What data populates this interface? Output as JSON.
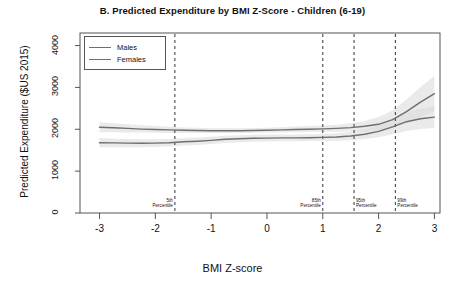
{
  "chart_data": {
    "type": "line",
    "title": "B. Predicted Expenditure by BMI Z-Score - Children (6-19)",
    "xlabel": "BMI Z-score",
    "ylabel": "Predicted Expenditure ($US 2015)",
    "xlim": [
      -3.35,
      3.1
    ],
    "ylim": [
      0,
      4300
    ],
    "xticks": [
      -3,
      -2,
      -1,
      0,
      1,
      2,
      3
    ],
    "xtick_labels": [
      "-3",
      "-2",
      "-1",
      "0",
      "1",
      "2",
      "3"
    ],
    "yticks": [
      0,
      1000,
      2000,
      3000,
      4000
    ],
    "ytick_labels": [
      "0",
      "1000",
      "2000",
      "3000",
      "4000"
    ],
    "grid": false,
    "legend_position": "top-left",
    "legend_entries": [
      "Males",
      "Females"
    ],
    "line_color": "#6f6f6f",
    "band_color": "#d9d9d9",
    "x": [
      -3.0,
      -2.75,
      -2.5,
      -2.25,
      -2.0,
      -1.75,
      -1.5,
      -1.25,
      -1.0,
      -0.75,
      -0.5,
      -0.25,
      0.0,
      0.25,
      0.5,
      0.75,
      1.0,
      1.25,
      1.5,
      1.75,
      2.0,
      2.25,
      2.5,
      2.75,
      3.0
    ],
    "series": [
      {
        "name": "Males",
        "values": [
          2050,
          2035,
          2020,
          2005,
          1995,
          1985,
          1975,
          1970,
          1965,
          1965,
          1965,
          1970,
          1975,
          1985,
          1995,
          2000,
          2010,
          2020,
          2040,
          2070,
          2120,
          2230,
          2420,
          2650,
          2850
        ],
        "ci_low": [
          1930,
          1930,
          1925,
          1920,
          1915,
          1910,
          1910,
          1910,
          1910,
          1910,
          1910,
          1915,
          1920,
          1925,
          1930,
          1935,
          1940,
          1940,
          1945,
          1950,
          1970,
          2030,
          2150,
          2300,
          2430
        ],
        "ci_high": [
          2170,
          2145,
          2120,
          2095,
          2080,
          2060,
          2045,
          2035,
          2025,
          2025,
          2025,
          2030,
          2035,
          2050,
          2065,
          2075,
          2090,
          2110,
          2145,
          2200,
          2290,
          2450,
          2710,
          3010,
          3280
        ]
      },
      {
        "name": "Females",
        "values": [
          1680,
          1675,
          1670,
          1668,
          1670,
          1680,
          1700,
          1715,
          1735,
          1760,
          1775,
          1785,
          1790,
          1795,
          1795,
          1800,
          1805,
          1815,
          1840,
          1880,
          1950,
          2060,
          2180,
          2250,
          2290
        ],
        "ci_low": [
          1570,
          1570,
          1570,
          1572,
          1578,
          1590,
          1610,
          1628,
          1650,
          1675,
          1692,
          1702,
          1708,
          1713,
          1715,
          1718,
          1720,
          1725,
          1740,
          1765,
          1810,
          1880,
          1960,
          2010,
          2030
        ],
        "ci_high": [
          1790,
          1780,
          1770,
          1764,
          1762,
          1770,
          1790,
          1802,
          1820,
          1845,
          1858,
          1868,
          1872,
          1877,
          1875,
          1882,
          1890,
          1905,
          1940,
          1995,
          2090,
          2240,
          2400,
          2490,
          2550
        ]
      }
    ],
    "reference_lines": [
      {
        "x": -1.65,
        "label_line1": "5th",
        "label_line2": "Percentile",
        "align": "right"
      },
      {
        "x": 1.0,
        "label_line1": "85th",
        "label_line2": "Percentile",
        "align": "right"
      },
      {
        "x": 1.56,
        "label_line1": "95th",
        "label_line2": "Percentile",
        "align": "left"
      },
      {
        "x": 2.3,
        "label_line1": "99th",
        "label_line2": "Percentile",
        "align": "left"
      }
    ]
  }
}
